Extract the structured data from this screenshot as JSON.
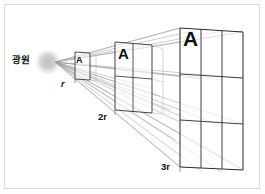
{
  "diagram": {
    "source_label": "광원",
    "area_label": "A",
    "distance_labels": {
      "d1": "r",
      "d2": "2r",
      "d3": "3r"
    },
    "panels": [
      {
        "distance": "r",
        "grid": "1x1",
        "cells": 1,
        "area_multiple": 1,
        "area_text": "A"
      },
      {
        "distance": "2r",
        "grid": "2x2",
        "cells": 4,
        "area_multiple": 4,
        "area_text": "A"
      },
      {
        "distance": "3r",
        "grid": "3x3",
        "cells": 9,
        "area_multiple": 9,
        "area_text": "A"
      }
    ],
    "colors": {
      "background": "#ffffff",
      "border": "#dcdcdc",
      "line_dark": "#2b2b2b",
      "line_light": "#b3b3b3",
      "ray": "#9a9a9a",
      "source_glow": "#c9c9c9",
      "text": "#111111"
    }
  }
}
